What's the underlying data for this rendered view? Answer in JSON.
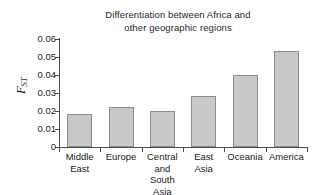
{
  "chart_data": {
    "type": "bar",
    "title": "Differentiation between Africa and other geographic regions",
    "title_lines": [
      "Differentiation between Africa and",
      "other geographic regions"
    ],
    "xlabel": "",
    "ylabel": "F_ST",
    "ylabel_symbol": "F",
    "ylabel_subscript": "ST",
    "categories": [
      "Middle East",
      "Europe",
      "Central and South Asia",
      "East Asia",
      "Oceania",
      "America"
    ],
    "category_lines": [
      [
        "Middle",
        "East"
      ],
      [
        "Europe"
      ],
      [
        "Central",
        "and",
        "South Asia"
      ],
      [
        "East",
        "Asia"
      ],
      [
        "Oceania"
      ],
      [
        "America"
      ]
    ],
    "values": [
      0.0183,
      0.0222,
      0.02,
      0.0284,
      0.04,
      0.0533
    ],
    "ylim": [
      0,
      0.06
    ],
    "yticks": [
      0,
      0.01,
      0.02,
      0.03,
      0.04,
      0.05,
      0.06
    ],
    "ytick_labels": [
      "0",
      "0.01",
      "0.02",
      "0.03",
      "0.04",
      "0.05",
      "0.06"
    ],
    "grid": false,
    "legend": null,
    "bar_color": "#c9c9c9",
    "bar_edge_color": "#8c8c8c",
    "axis_color": "#4d4d4d"
  }
}
